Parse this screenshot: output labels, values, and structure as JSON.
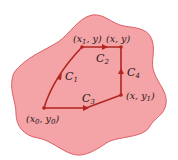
{
  "colors": {
    "region_fill": "#f4a3a6",
    "region_stroke": "#d9545c",
    "path": "#b0261f",
    "text": "#2a1a1a",
    "background": "#ffffff"
  },
  "points": {
    "p0": {
      "label": "(x0, y0)",
      "x": 44,
      "y": 108
    },
    "p1": {
      "label": "(x1, y)",
      "x": 82,
      "y": 47
    },
    "p2": {
      "label": "(x, y)",
      "x": 121,
      "y": 47
    },
    "p3": {
      "label": "(x, y1)",
      "x": 121,
      "y": 95
    }
  },
  "curves": [
    {
      "name": "C1",
      "from": "(x0, y0)",
      "to": "(x1, y)"
    },
    {
      "name": "C2",
      "from": "(x1, y)",
      "to": "(x, y)"
    },
    {
      "name": "C3",
      "from": "(x0, y0)",
      "to": "(x, y1)"
    },
    {
      "name": "C4",
      "from": "(x, y1)",
      "to": "(x, y)"
    }
  ],
  "labels": {
    "p0": {
      "open": "(",
      "x": "x",
      "xsub": "0",
      "sep": ", ",
      "y": "y",
      "ysub": "0",
      "close": ")"
    },
    "p1": {
      "open": "(",
      "x": "x",
      "xsub": "1",
      "sep": ", ",
      "y": "y",
      "close": ")"
    },
    "p2": {
      "text": "(x, y)"
    },
    "p3": {
      "open": "(",
      "x": "x",
      "sep": ", ",
      "y": "y",
      "ysub": "1",
      "close": ")"
    },
    "c1": {
      "c": "C",
      "sub": "1"
    },
    "c2": {
      "c": "C",
      "sub": "2"
    },
    "c3": {
      "c": "C",
      "sub": "3"
    },
    "c4": {
      "c": "C",
      "sub": "4"
    }
  }
}
